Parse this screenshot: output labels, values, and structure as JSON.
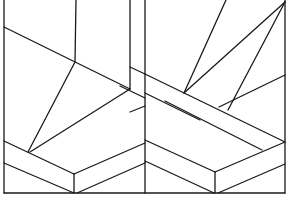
{
  "figure": {
    "title": "",
    "stroke_color": "#1a1a1a",
    "background": "#ffffff"
  },
  "lines": [
    {
      "id": "frame-left",
      "x1": 4,
      "y1": 0,
      "x2": 4,
      "y2": 193
    },
    {
      "id": "frame-bottom",
      "x1": 4,
      "y1": 193,
      "x2": 285,
      "y2": 193
    },
    {
      "id": "frame-right",
      "x1": 285,
      "y1": 0,
      "x2": 285,
      "y2": 193
    },
    {
      "id": "center-divider",
      "x1": 145,
      "y1": 0,
      "x2": 145,
      "y2": 193
    },
    {
      "id": "left-post-a",
      "x1": 76,
      "y1": 0,
      "x2": 75,
      "y2": 62
    },
    {
      "id": "left-post-b",
      "x1": 130,
      "y1": 0,
      "x2": 130,
      "y2": 89
    },
    {
      "id": "left-diag-upper",
      "x1": 4,
      "y1": 27,
      "x2": 130,
      "y2": 89
    },
    {
      "id": "left-post-b-ext",
      "x1": 130,
      "y1": 67,
      "x2": 145,
      "y2": 74
    },
    {
      "id": "left-fan-1",
      "x1": 75,
      "y1": 62,
      "x2": 28,
      "y2": 152
    },
    {
      "id": "left-fan-2",
      "x1": 130,
      "y1": 89,
      "x2": 30,
      "y2": 152
    },
    {
      "id": "left-strip-top",
      "x1": 4,
      "y1": 141,
      "x2": 74,
      "y2": 174
    },
    {
      "id": "left-strip-bot",
      "x1": 4,
      "y1": 163,
      "x2": 74,
      "y2": 193
    },
    {
      "id": "left-v-join",
      "x1": 74,
      "y1": 174,
      "x2": 74,
      "y2": 193
    },
    {
      "id": "left-up-top",
      "x1": 74,
      "y1": 174,
      "x2": 145,
      "y2": 143
    },
    {
      "id": "left-up-bot",
      "x1": 77,
      "y1": 193,
      "x2": 145,
      "y2": 163
    },
    {
      "id": "mid-diag-1",
      "x1": 120,
      "y1": 86,
      "x2": 145,
      "y2": 98
    },
    {
      "id": "mid-diag-2",
      "x1": 130,
      "y1": 112,
      "x2": 145,
      "y2": 106
    },
    {
      "id": "right-strip-a-top",
      "x1": 145,
      "y1": 74,
      "x2": 285,
      "y2": 142
    },
    {
      "id": "right-strip-a-bot",
      "x1": 145,
      "y1": 93,
      "x2": 200,
      "y2": 120
    },
    {
      "id": "right-fan-1",
      "x1": 226,
      "y1": 0,
      "x2": 184,
      "y2": 93
    },
    {
      "id": "right-fan-2",
      "x1": 285,
      "y1": 2,
      "x2": 184,
      "y2": 93
    },
    {
      "id": "right-fan-3",
      "x1": 285,
      "y1": 2,
      "x2": 228,
      "y2": 110
    },
    {
      "id": "right-fan-4",
      "x1": 285,
      "y1": 75,
      "x2": 219,
      "y2": 107
    },
    {
      "id": "right-strip-b-top",
      "x1": 145,
      "y1": 140,
      "x2": 215,
      "y2": 172
    },
    {
      "id": "right-strip-b-bot",
      "x1": 145,
      "y1": 161,
      "x2": 214,
      "y2": 193
    },
    {
      "id": "right-v-join",
      "x1": 215,
      "y1": 172,
      "x2": 215,
      "y2": 193
    },
    {
      "id": "right-up-top",
      "x1": 215,
      "y1": 172,
      "x2": 285,
      "y2": 142
    },
    {
      "id": "right-up-bot",
      "x1": 218,
      "y1": 193,
      "x2": 285,
      "y2": 164
    },
    {
      "id": "right-diag-long",
      "x1": 165,
      "y1": 101,
      "x2": 262,
      "y2": 150
    }
  ]
}
